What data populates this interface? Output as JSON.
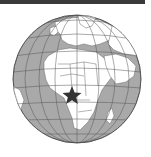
{
  "map": {
    "type": "orthographic-locator-globe",
    "center_region": "Africa",
    "highlight_marker": "star",
    "highlight_location": "Central West Africa (Gulf of Guinea)",
    "colors": {
      "ocean": "#a9a9a9",
      "land": "#ffffff",
      "border": "#6a6a6a",
      "graticule": "#555555",
      "marker": "#333333",
      "topbar": "#3a3a3a"
    }
  },
  "labels": {
    "marker_label": "Location marker"
  }
}
